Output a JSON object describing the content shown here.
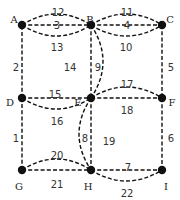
{
  "diagram": {
    "type": "graph",
    "nodes": [
      {
        "id": "A",
        "label": "A",
        "x": 22,
        "y": 25,
        "lx": 14,
        "ly": 19
      },
      {
        "id": "B",
        "label": "B",
        "x": 91,
        "y": 25,
        "lx": 90,
        "ly": 19
      },
      {
        "id": "C",
        "label": "C",
        "x": 162,
        "y": 25,
        "lx": 170,
        "ly": 19
      },
      {
        "id": "D",
        "label": "D",
        "x": 22,
        "y": 98,
        "lx": 10,
        "ly": 102
      },
      {
        "id": "E",
        "label": "E",
        "x": 91,
        "y": 98,
        "lx": 78,
        "ly": 102
      },
      {
        "id": "F",
        "label": "F",
        "x": 162,
        "y": 98,
        "lx": 172,
        "ly": 102
      },
      {
        "id": "G",
        "label": "G",
        "x": 22,
        "y": 170,
        "lx": 19,
        "ly": 186
      },
      {
        "id": "H",
        "label": "H",
        "x": 91,
        "y": 170,
        "lx": 88,
        "ly": 186
      },
      {
        "id": "I",
        "label": "I",
        "x": 162,
        "y": 170,
        "lx": 166,
        "ly": 186
      }
    ],
    "edges": [
      {
        "label": "1",
        "from": "G",
        "to": "D",
        "curve": 0,
        "lx": 16,
        "ly": 138
      },
      {
        "label": "2",
        "from": "D",
        "to": "A",
        "curve": 0,
        "lx": 16,
        "ly": 67
      },
      {
        "label": "3",
        "from": "A",
        "to": "B",
        "curve": 0,
        "lx": 57,
        "ly": 25
      },
      {
        "label": "4",
        "from": "B",
        "to": "C",
        "curve": 0,
        "lx": 127,
        "ly": 25
      },
      {
        "label": "5",
        "from": "C",
        "to": "F",
        "curve": 0,
        "lx": 171,
        "ly": 67
      },
      {
        "label": "6",
        "from": "F",
        "to": "I",
        "curve": 0,
        "lx": 171,
        "ly": 138
      },
      {
        "label": "7",
        "from": "H",
        "to": "I",
        "curve": 0,
        "lx": 128,
        "ly": 167
      },
      {
        "label": "8",
        "from": "E",
        "to": "H",
        "curve": 0,
        "lx": 85,
        "ly": 138
      },
      {
        "label": "9",
        "from": "B",
        "to": "E",
        "curve": 0,
        "lx": 98,
        "ly": 67
      },
      {
        "label": "10",
        "from": "B",
        "to": "C",
        "curve": 11,
        "lx": 126,
        "ly": 47
      },
      {
        "label": "11",
        "from": "B",
        "to": "C",
        "curve": -11,
        "lx": 127,
        "ly": 12
      },
      {
        "label": "12",
        "from": "A",
        "to": "B",
        "curve": -11,
        "lx": 58,
        "ly": 12
      },
      {
        "label": "13",
        "from": "A",
        "to": "B",
        "curve": 11,
        "lx": 57,
        "ly": 47
      },
      {
        "label": "14",
        "from": "B",
        "to": "E",
        "curve": -12,
        "lx": 70,
        "ly": 67
      },
      {
        "label": "15",
        "from": "D",
        "to": "E",
        "curve": 0,
        "lx": 55,
        "ly": 94
      },
      {
        "label": "16",
        "from": "D",
        "to": "E",
        "curve": 11,
        "lx": 57,
        "ly": 121
      },
      {
        "label": "17",
        "from": "E",
        "to": "F",
        "curve": -11,
        "lx": 127,
        "ly": 84
      },
      {
        "label": "18",
        "from": "E",
        "to": "F",
        "curve": 0,
        "lx": 127,
        "ly": 110
      },
      {
        "label": "19",
        "from": "E",
        "to": "H",
        "curve": 12,
        "lx": 109,
        "ly": 141
      },
      {
        "label": "20",
        "from": "G",
        "to": "H",
        "curve": -11,
        "lx": 57,
        "ly": 155
      },
      {
        "label": "21",
        "from": "G",
        "to": "H",
        "curve": 0,
        "lx": 57,
        "ly": 184
      },
      {
        "label": "22",
        "from": "H",
        "to": "I",
        "curve": 11,
        "lx": 127,
        "ly": 193
      }
    ]
  },
  "colors": {
    "edge": "#111111",
    "node": "#111111",
    "label": "#333333",
    "background": "#ffffff"
  }
}
